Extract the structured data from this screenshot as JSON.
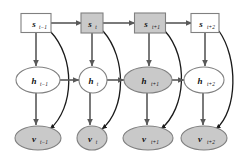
{
  "figure": {
    "type": "probabilistic-graphical-model",
    "title": "",
    "background_color": "#ffffff",
    "colors": {
      "shaded_node_fill": "#c9c9c9",
      "unshaded_node_fill": "#ffffff",
      "node_stroke": "#808080",
      "edge_stroke": "#595959",
      "curved_edge_stroke": "#1a1a1a",
      "label_color": "#111111"
    }
  },
  "layers": {
    "state_row": {
      "name": "state-layer",
      "shape": "rectangle",
      "nodes": [
        {
          "id": "s-t-minus-1",
          "base": "s",
          "subscript": "t−1",
          "shaded": false,
          "cx": 36,
          "cy": 23,
          "w": 30,
          "h": 19
        },
        {
          "id": "s-t",
          "base": "s",
          "subscript": "t",
          "shaded": true,
          "cx": 92,
          "cy": 23,
          "w": 22,
          "h": 20
        },
        {
          "id": "s-t-plus-1",
          "base": "s",
          "subscript": "t+1",
          "shaded": true,
          "cx": 150,
          "cy": 23,
          "w": 31,
          "h": 20
        },
        {
          "id": "s-t-plus-2",
          "base": "s",
          "subscript": "t+2",
          "shaded": false,
          "cx": 205,
          "cy": 23,
          "w": 28,
          "h": 19
        }
      ]
    },
    "hidden_row": {
      "name": "hidden-layer",
      "shape": "ellipse",
      "nodes": [
        {
          "id": "h-t-minus-1",
          "base": "h",
          "subscript": "t−1",
          "shaded": false,
          "cx": 38,
          "cy": 80,
          "rx": 22,
          "ry": 13
        },
        {
          "id": "h-t",
          "base": "h",
          "subscript": "t",
          "shaded": false,
          "cx": 93,
          "cy": 80,
          "rx": 14,
          "ry": 13
        },
        {
          "id": "h-t-plus-1",
          "base": "h",
          "subscript": "t+1",
          "shaded": true,
          "cx": 148,
          "cy": 80,
          "rx": 24,
          "ry": 13
        },
        {
          "id": "h-t-plus-2",
          "base": "h",
          "subscript": "t+2",
          "shaded": false,
          "cx": 204,
          "cy": 80,
          "rx": 20,
          "ry": 13
        }
      ]
    },
    "visible_row": {
      "name": "visible-layer",
      "shape": "ellipse",
      "nodes": [
        {
          "id": "v-t-minus-1",
          "base": "v",
          "subscript": "t−1",
          "shaded": true,
          "cx": 38,
          "cy": 138,
          "rx": 23,
          "ry": 12
        },
        {
          "id": "v-t",
          "base": "v",
          "subscript": "t",
          "shaded": true,
          "cx": 92,
          "cy": 138,
          "rx": 15,
          "ry": 12
        },
        {
          "id": "v-t-plus-1",
          "base": "v",
          "subscript": "t+1",
          "shaded": true,
          "cx": 148,
          "cy": 138,
          "rx": 25,
          "ry": 12
        },
        {
          "id": "v-t-plus-2",
          "base": "v",
          "subscript": "t+2",
          "shaded": true,
          "cx": 204,
          "cy": 138,
          "rx": 23,
          "ry": 12
        }
      ]
    }
  },
  "edges": {
    "state_chain": [
      {
        "from": "s-t-minus-1",
        "to": "s-t"
      },
      {
        "from": "s-t",
        "to": "s-t-plus-1"
      },
      {
        "from": "s-t-plus-1",
        "to": "s-t-plus-2"
      }
    ],
    "hidden_chain": [
      {
        "from": "h-t-minus-1",
        "to": "h-t"
      },
      {
        "from": "h-t",
        "to": "h-t-plus-1"
      },
      {
        "from": "h-t-plus-1",
        "to": "h-t-plus-2"
      }
    ],
    "state_to_hidden": [
      {
        "from": "s-t-minus-1",
        "to": "h-t-minus-1"
      },
      {
        "from": "s-t",
        "to": "h-t"
      },
      {
        "from": "s-t-plus-1",
        "to": "h-t-plus-1"
      },
      {
        "from": "s-t-plus-2",
        "to": "h-t-plus-2"
      }
    ],
    "hidden_to_visible": [
      {
        "from": "h-t-minus-1",
        "to": "v-t-minus-1"
      },
      {
        "from": "h-t",
        "to": "v-t"
      },
      {
        "from": "h-t-plus-1",
        "to": "v-t-plus-1"
      },
      {
        "from": "h-t-plus-2",
        "to": "v-t-plus-2"
      }
    ],
    "state_to_visible_curved": [
      {
        "from": "s-t-minus-1",
        "to": "v-t-minus-1"
      },
      {
        "from": "s-t",
        "to": "v-t"
      },
      {
        "from": "s-t-plus-1",
        "to": "v-t-plus-1"
      },
      {
        "from": "s-t-plus-2",
        "to": "v-t-plus-2"
      }
    ]
  }
}
